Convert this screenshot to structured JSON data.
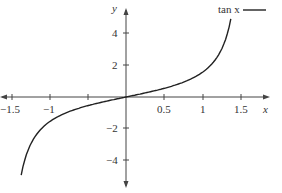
{
  "chart_data": {
    "type": "line",
    "title": "",
    "xlabel": "x",
    "ylabel": "y",
    "xlim": [
      -1.5,
      1.5
    ],
    "ylim": [
      -5,
      5
    ],
    "x_ticks": [
      -1.5,
      -1,
      -0.5,
      0,
      0.5,
      1,
      1.5
    ],
    "x_tick_labels": [
      "−1.5",
      "−1",
      "",
      "",
      "0.5",
      "1",
      "1.5"
    ],
    "y_ticks": [
      -4,
      -2,
      2,
      4
    ],
    "y_tick_labels": [
      "−4",
      "−2",
      "2",
      "4"
    ],
    "grid": false,
    "legend": {
      "position": "top-right",
      "entries": [
        "tan x"
      ]
    },
    "series": [
      {
        "name": "tan x",
        "x": [
          -1.37,
          -1.3,
          -1.2,
          -1.0,
          -0.8,
          -0.6,
          -0.4,
          -0.2,
          0,
          0.2,
          0.4,
          0.6,
          0.8,
          1.0,
          1.2,
          1.3,
          1.37
        ],
        "values": [
          -4.9,
          -3.6,
          -2.57,
          -1.56,
          -1.03,
          -0.68,
          -0.42,
          -0.2,
          0,
          0.2,
          0.42,
          0.68,
          1.03,
          1.56,
          2.57,
          3.6,
          4.9
        ]
      }
    ]
  },
  "legend_label": "tan x",
  "axis": {
    "x": "x",
    "y": "y"
  },
  "xticks": {
    "m15": "−1.5",
    "m1": "−1",
    "p05": "0.5",
    "p1": "1",
    "p15": "1.5"
  },
  "yticks": {
    "p4": "4",
    "p2": "2",
    "m2": "−2",
    "m4": "−4"
  }
}
